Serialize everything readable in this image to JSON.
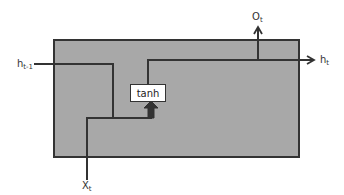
{
  "diagram": {
    "type": "rnn-cell",
    "colors": {
      "cell_fill": "#a8a8a8",
      "stroke": "#333333",
      "background": "#ffffff"
    },
    "nodes": {
      "activation": "tanh"
    },
    "labels": {
      "prev_hidden": {
        "base": "h",
        "sub": "t-1"
      },
      "input": {
        "base": "X",
        "sub": "t"
      },
      "output": {
        "base": "O",
        "sub": "t"
      },
      "hidden": {
        "base": "h",
        "sub": "t"
      }
    }
  }
}
